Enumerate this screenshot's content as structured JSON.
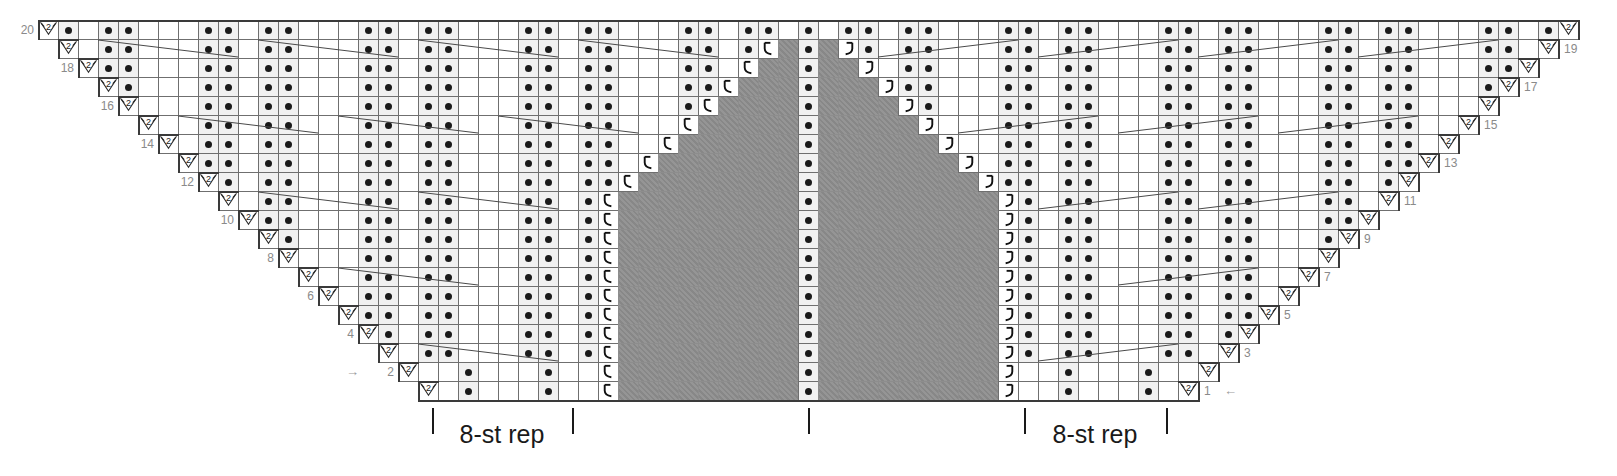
{
  "chart_data": {
    "type": "table",
    "grid": {
      "rows": 20,
      "cols": 77,
      "cell_w": 20,
      "cell_h": 19,
      "origin_x": 38,
      "origin_y": 20
    },
    "legend_symbols": {
      "purl": "purl-dot",
      "decrease": "2",
      "yarnover_left": "hook-left",
      "yarnover_right": "hook-right",
      "no_stitch": "shaded-block"
    },
    "row_numbers_left": [
      {
        "label": "20",
        "row": 20
      },
      {
        "label": "18",
        "row": 18
      },
      {
        "label": "16",
        "row": 16
      },
      {
        "label": "14",
        "row": 14
      },
      {
        "label": "12",
        "row": 12
      },
      {
        "label": "10",
        "row": 10
      },
      {
        "label": "8",
        "row": 8
      },
      {
        "label": "6",
        "row": 6
      },
      {
        "label": "4",
        "row": 4
      },
      {
        "label": "2",
        "row": 2
      }
    ],
    "row_numbers_right": [
      {
        "label": "19",
        "row": 19
      },
      {
        "label": "17",
        "row": 17
      },
      {
        "label": "15",
        "row": 15
      },
      {
        "label": "13",
        "row": 13
      },
      {
        "label": "11",
        "row": 11
      },
      {
        "label": "9",
        "row": 9
      },
      {
        "label": "7",
        "row": 7
      },
      {
        "label": "5",
        "row": 5
      },
      {
        "label": "3",
        "row": 3
      },
      {
        "label": "1",
        "row": 1
      }
    ],
    "direction_arrows": [
      {
        "name": "row-2-direction-arrow",
        "glyph": "→",
        "row": 2,
        "side": "left"
      },
      {
        "name": "row-1-direction-arrow",
        "glyph": "←",
        "row": 1,
        "side": "right"
      }
    ],
    "repeat_labels": [
      {
        "text": "8-st rep",
        "side": "left"
      },
      {
        "text": "8-st rep",
        "side": "right"
      }
    ],
    "colors": {
      "grid_line": "#6f6f6f",
      "purl_cell": "#f1f1f1",
      "no_stitch": "#8d8d8d",
      "dot": "#1a1a1a",
      "row_number": "#8a8a8a",
      "outline": "#3a3a3a",
      "label": "#1a1a1a",
      "background": "#ffffff"
    }
  }
}
